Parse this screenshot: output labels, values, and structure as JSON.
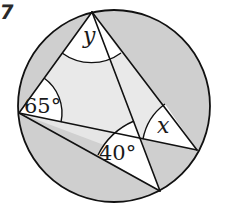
{
  "problem_number": "7",
  "diagram": {
    "type": "circle-inscribed-angles",
    "circle": {
      "cx": 114,
      "cy": 106,
      "r": 96
    },
    "points": {
      "T": [
        92,
        12
      ],
      "L": [
        19,
        113
      ],
      "R": [
        197,
        150
      ],
      "B": [
        160,
        191
      ],
      "P": [
        142,
        139
      ]
    },
    "chords": [
      [
        "T",
        "L"
      ],
      [
        "T",
        "B"
      ],
      [
        "T",
        "R"
      ],
      [
        "L",
        "R"
      ],
      [
        "L",
        "B"
      ]
    ],
    "angle_labels": {
      "top": "y",
      "left": "65°",
      "bottom": "40°",
      "right": "x"
    },
    "colors": {
      "outer_shade": "#cfcfcf",
      "inner_shade": "#e9e9e9",
      "angle_sector": "#ffffff",
      "stroke": "#111111"
    }
  }
}
